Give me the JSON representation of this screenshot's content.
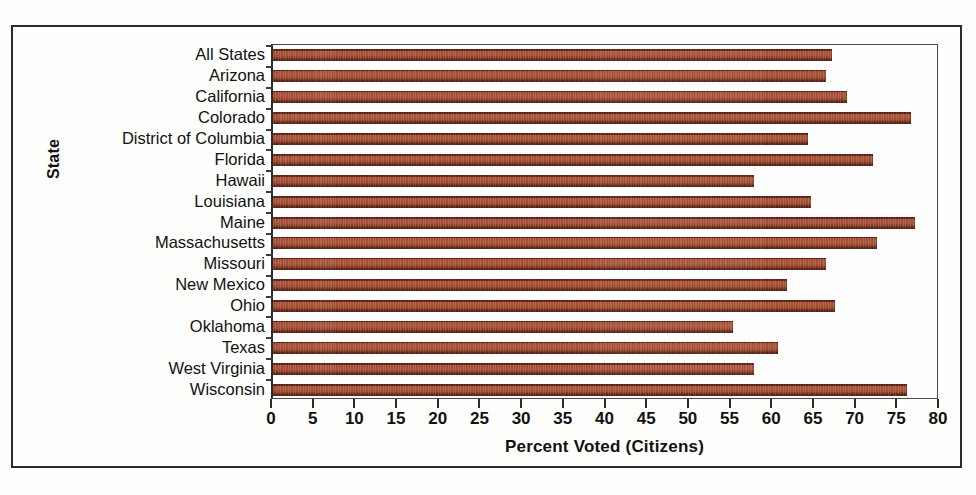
{
  "figure": {
    "background_color": "#fdfdfb",
    "frame_color": "#2b2b2b"
  },
  "chart_data": {
    "type": "bar",
    "orientation": "horizontal",
    "title": "",
    "xlabel": "Percent Voted (Citizens)",
    "ylabel": "State",
    "xlim": [
      0,
      80
    ],
    "xticks": [
      0,
      5,
      10,
      15,
      20,
      25,
      30,
      35,
      40,
      45,
      50,
      55,
      60,
      65,
      70,
      75,
      80
    ],
    "grid": false,
    "legend": null,
    "bar_color": "#a8523a",
    "bar_edge_color": "#5e2415",
    "categories": [
      "All States",
      "Arizona",
      "California",
      "Colorado",
      "District of Columbia",
      "Florida",
      "Hawaii",
      "Louisiana",
      "Maine",
      "Massachusetts",
      "Missouri",
      "New Mexico",
      "Ohio",
      "Oklahoma",
      "Texas",
      "West Virginia",
      "Wisconsin"
    ],
    "values": [
      67.0,
      66.3,
      68.9,
      76.5,
      64.2,
      72.0,
      57.7,
      64.5,
      77.0,
      72.5,
      66.3,
      61.6,
      67.4,
      55.2,
      60.6,
      57.7,
      76.0
    ]
  }
}
